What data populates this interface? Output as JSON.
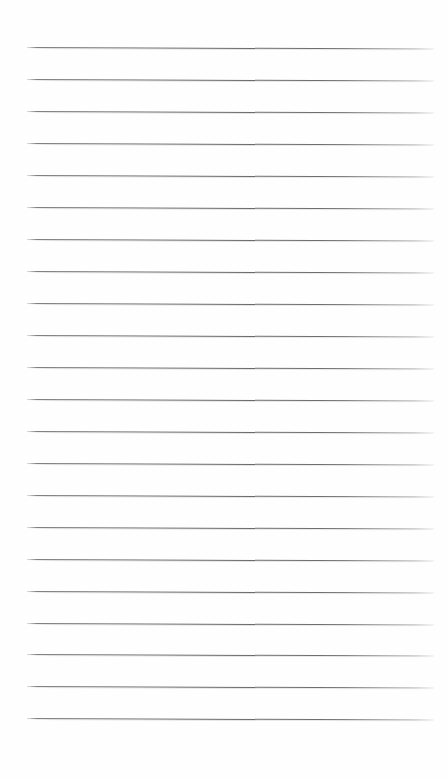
{
  "document": {
    "kind": "lined-paper-sheet",
    "title": "Blank Lined Notepaper",
    "text_content": "",
    "background_color": "#ffffff",
    "paper_color": "#fefefe",
    "rule_color": "#606266",
    "page_width": 447,
    "page_height": 781
  },
  "ruling": {
    "line_count": 22,
    "first_line_y": 47,
    "line_spacing": 32,
    "line_start_x": 27,
    "line_end_x": 434,
    "line_thickness": 1,
    "tilt_degrees": 0.22,
    "lines": [
      {
        "index": 1,
        "y": 47
      },
      {
        "index": 2,
        "y": 79
      },
      {
        "index": 3,
        "y": 111
      },
      {
        "index": 4,
        "y": 143
      },
      {
        "index": 5,
        "y": 175
      },
      {
        "index": 6,
        "y": 207
      },
      {
        "index": 7,
        "y": 239
      },
      {
        "index": 8,
        "y": 271
      },
      {
        "index": 9,
        "y": 303
      },
      {
        "index": 10,
        "y": 335
      },
      {
        "index": 11,
        "y": 367
      },
      {
        "index": 12,
        "y": 399
      },
      {
        "index": 13,
        "y": 431
      },
      {
        "index": 14,
        "y": 463
      },
      {
        "index": 15,
        "y": 495
      },
      {
        "index": 16,
        "y": 527
      },
      {
        "index": 17,
        "y": 559
      },
      {
        "index": 18,
        "y": 591
      },
      {
        "index": 19,
        "y": 623
      },
      {
        "index": 20,
        "y": 654
      },
      {
        "index": 21,
        "y": 686
      },
      {
        "index": 22,
        "y": 718
      }
    ]
  },
  "margins": {
    "top_margin_height": 47,
    "bottom_margin_height": 63,
    "left_margin_width": 27,
    "right_margin_width": 13
  }
}
